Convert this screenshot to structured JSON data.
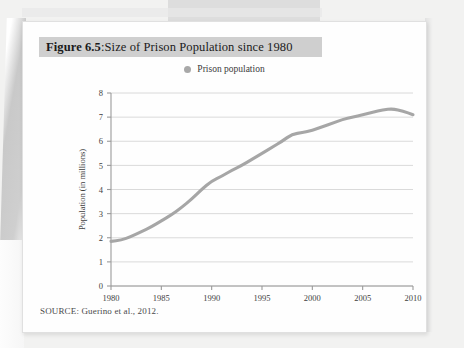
{
  "page": {
    "figure_label": "Figure 6.5",
    "figure_separator": ": ",
    "figure_title": "Size of Prison Population since 1980",
    "source": "SOURCE: Guerino et al., 2012."
  },
  "colors": {
    "line": "#a6a6a6",
    "gridline": "#d6d6d6",
    "axis": "#9a9a9a",
    "title_highlight": "#cfcfcf",
    "text": "#1b1b1b",
    "page": "#fefefe",
    "background": "#f2f2f1"
  },
  "chart_data": {
    "type": "line",
    "title": "Size of Prison Population since 1980",
    "xlabel": "",
    "ylabel": "Population (in millions)",
    "xlim": [
      1980,
      2010
    ],
    "ylim": [
      0,
      8
    ],
    "grid": true,
    "legend_position": "top-center",
    "xticks": [
      1980,
      1985,
      1990,
      1995,
      2000,
      2005,
      2010
    ],
    "yticks": [
      0,
      1,
      2,
      3,
      4,
      5,
      6,
      7,
      8
    ],
    "series": [
      {
        "name": "Prison population",
        "color": "#a6a6a6",
        "x": [
          1980,
          1981,
          1982,
          1983,
          1984,
          1985,
          1986,
          1987,
          1988,
          1989,
          1990,
          1991,
          1992,
          1993,
          1994,
          1995,
          1996,
          1997,
          1998,
          1999,
          2000,
          2001,
          2002,
          2003,
          2004,
          2005,
          2006,
          2007,
          2008,
          2009,
          2010
        ],
        "values": [
          1.85,
          1.9,
          2.05,
          2.25,
          2.45,
          2.7,
          2.95,
          3.25,
          3.6,
          4.0,
          4.35,
          4.55,
          4.8,
          5.0,
          5.25,
          5.5,
          5.75,
          6.0,
          6.3,
          6.35,
          6.45,
          6.6,
          6.75,
          6.9,
          7.0,
          7.1,
          7.2,
          7.3,
          7.35,
          7.25,
          7.1
        ]
      }
    ]
  }
}
